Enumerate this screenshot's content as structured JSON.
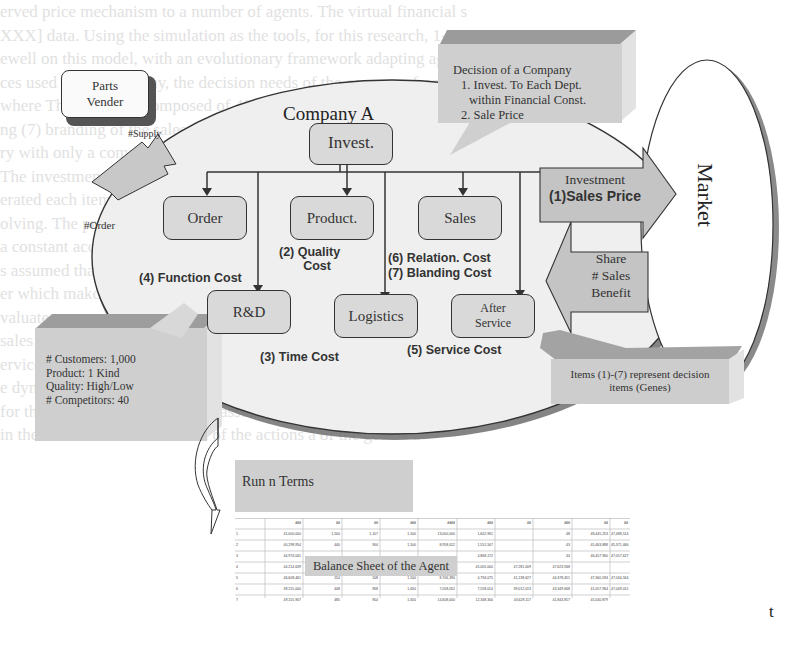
{
  "background_text": [
    "erved price mechanism to a number of agents. The virtual financial s",
    "XXX] data. Using the simulation as the tools, for this research, 1-7,",
    "ewell on this model, with an evolutionary framework adapting agent type",
    "ces used in the economy, the decision needs of the company from both",
    "where The market is composed of 40 companies. (1) Decision of cost",
    "ng (7) branding of the sales offices to each department pursue. We m",
    "ry with only a common market.",
    "The investment of a company is done by Depot.. Further, it is assumed",
    "erated each item and is decided annually and each term are reflected",
    "olving. The price also sold to the system. s = Σ ( ) n",
    "a constant according to the customer value, v = ( ... )",
    "s assumed that this is a finite value approach a long-term agent. Thes",
    "er which make the same one term while to long-term cost",
    "valuate.",
    "sales in the market calculates interaction prices, be composed of a to",
    "ervice as competitive, taking an evolution both decision rules when t",
    "e dynamics is assumed that the hold the time of a conditions given by",
    "for this research agents who are assumed as of each term a market",
    "in the term with the evaluation of the actions a of the goal is a"
  ],
  "diagram": {
    "parts_vender": "Parts\nVender",
    "parts_vender_lines": [
      "Parts",
      "Vender"
    ],
    "supply_label": "#Supply",
    "order_label": "#Order",
    "company_title": "Company A",
    "invest_node": "Invest.",
    "departments": {
      "order": "Order",
      "product": "Product.",
      "sales": "Sales",
      "rnd": "R&D",
      "logistics": "Logistics",
      "after_service_lines": [
        "After",
        "Service"
      ]
    },
    "costs": {
      "quality": [
        "(2) Quality",
        "Cost"
      ],
      "function": "(4) Function  Cost",
      "relation": "(6) Relation. Cost",
      "blanding": "(7) Blanding Cost",
      "time": "(3) Time Cost",
      "service": "(5) Service Cost"
    },
    "decision_callout": {
      "title": "Decision  of a Company",
      "item1_line1": "1. Invest. To Each Dept.",
      "item1_line2": "within Financial Const.",
      "item2": "2. Sale Price"
    },
    "investment_arrow": {
      "line1": "Investment",
      "line2": "(1)Sales Price"
    },
    "share_arrow": {
      "lines": [
        "Share",
        "# Sales",
        "Benefit"
      ]
    },
    "market_label": "Market",
    "market_callout": {
      "lines": [
        "# Customers: 1,000",
        "Product:  1 Kind",
        "Quality: High/Low",
        "# Competitors: 40"
      ]
    },
    "genes_callout": {
      "lines": [
        "Items (1)-(7) represent decision",
        "items (Genes)"
      ]
    },
    "run_label": "Run n Terms",
    "balance_sheet_label": "Balance Sheet of the Agent",
    "balance_sheet": {
      "headers": [
        "",
        "###",
        "##",
        "##",
        "###",
        "####",
        "###",
        "##",
        "###",
        "##",
        "##"
      ],
      "rows": [
        [
          "1",
          "41,000,000",
          "1,500",
          "1,107",
          "1,500",
          "13,000,000",
          "1,602,961",
          "",
          "48",
          "48,445,253",
          "47,488,514",
          "8,960,891"
        ],
        [
          "2",
          "40,298,954",
          "440",
          "904",
          "1,500",
          "8,958,012",
          "1,551,567",
          "",
          "43",
          "45,463,888",
          "45,371,466",
          "47,127,344"
        ],
        [
          "3",
          "44,974,041",
          "",
          "",
          "",
          "",
          "4,868,172",
          "",
          "44",
          "46,457,960",
          "47,057,627",
          "47,021,127"
        ],
        [
          "4",
          "44,214,639",
          "",
          "",
          "",
          "4,972,000",
          "45,005,000",
          "47,281,009",
          "47,623,948",
          "",
          "",
          ""
        ],
        [
          "5",
          "46,608,461",
          "154",
          "108",
          "1,500",
          "8,706,390",
          "4,794,075",
          "41,138,627",
          "44,378,451",
          "47,360,594",
          "47,034,564",
          ""
        ],
        [
          "6",
          "39,215,000",
          "448",
          "968",
          "1,650",
          "7,058,052",
          "7,558,014",
          "39,012,013",
          "43,349,668",
          "41,057,964",
          "47,049,015",
          ""
        ],
        [
          "7",
          "49,155,907",
          "485",
          "904",
          "1,650",
          "14,608,000",
          "12,348,300",
          "43,628,117",
          "41,843,817",
          "45,040,879",
          "",
          ""
        ]
      ]
    },
    "page_fragment": "t"
  },
  "colors": {
    "ellipse_fill": "#efefef",
    "box_fill": "#d9d9d9",
    "callout_fill": "#cfcfcf",
    "callout_top": "#9e9e9e",
    "callout_side": "#e6e6e6",
    "stroke": "#333333",
    "shadow": "#777777"
  }
}
